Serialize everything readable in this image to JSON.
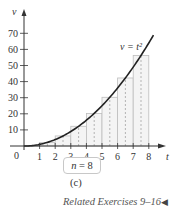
{
  "chart_data": {
    "type": "bar",
    "title": "",
    "curve_label": "v = t²",
    "xlabel": "t",
    "ylabel": "v",
    "origin_label": "0",
    "x_ticks": [
      1,
      2,
      3,
      4,
      5,
      6,
      7,
      8
    ],
    "y_ticks": [
      10,
      20,
      30,
      40,
      50,
      60,
      70
    ],
    "xlim": [
      0,
      8.8
    ],
    "ylim": [
      0,
      75
    ],
    "grid": false,
    "categories": [
      "[0,1]",
      "[1,2]",
      "[2,3]",
      "[3,4]",
      "[4,5]",
      "[5,6]",
      "[6,7]",
      "[7,8]"
    ],
    "midpoints": [
      0.5,
      1.5,
      2.5,
      3.5,
      4.5,
      5.5,
      6.5,
      7.5
    ],
    "values": [
      0.25,
      2.25,
      6.25,
      12.25,
      20.25,
      30.25,
      42.25,
      56.25
    ],
    "curve": {
      "function": "t^2",
      "x_range": [
        0,
        8
      ]
    },
    "n_label": "n = 8"
  },
  "figure": {
    "n_label_prefix": "n",
    "n_label_rest": " = 8",
    "caption": "(c)",
    "footer": "Related Exercises 9–16",
    "footer_icon": "◀"
  }
}
